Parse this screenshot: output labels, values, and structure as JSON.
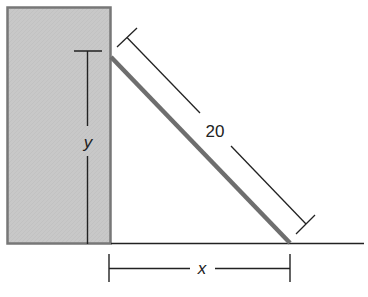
{
  "diagram": {
    "type": "ladder-against-wall",
    "labels": {
      "ladder_length": "20",
      "height": "y",
      "base_distance": "x"
    },
    "colors": {
      "wall_fill": "#c8c8c8",
      "wall_border": "#777777",
      "ladder": "#6e6e6e",
      "lines": "#222222",
      "background": "#ffffff"
    },
    "elements": [
      "wall",
      "ladder",
      "ground-line",
      "ladder-length-dimension",
      "height-dimension",
      "base-distance-dimension"
    ]
  }
}
